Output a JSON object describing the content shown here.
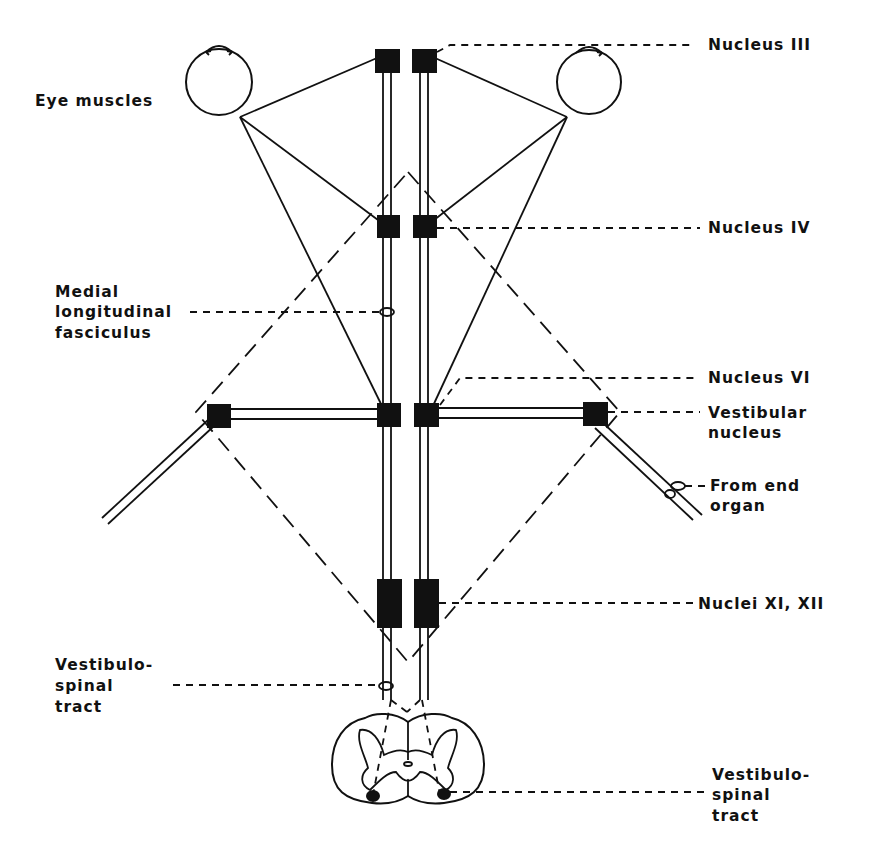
{
  "diagram": {
    "labels": {
      "eye_muscles": "Eye muscles",
      "nucleus_iii": "Nucleus III",
      "nucleus_iv": "Nucleus IV",
      "mlf_line1": "Medial",
      "mlf_line2": "longitudinal",
      "mlf_line3": "fasciculus",
      "nucleus_vi": "Nucleus VI",
      "vestibular_line1": "Vestibular",
      "vestibular_line2": "nucleus",
      "end_organ_line1": "From end",
      "end_organ_line2": "organ",
      "nuclei_xi_xii": "Nuclei XI, XII",
      "vs_left_line1": "Vestibulo-",
      "vs_left_line2": "spinal",
      "vs_left_line3": "tract",
      "vs_right_line1": "Vestibulo-",
      "vs_right_line2": "spinal",
      "vs_right_line3": "tract"
    },
    "colors": {
      "ink": "#111111",
      "background": "#ffffff",
      "stipple": "#e9e9e9"
    }
  }
}
